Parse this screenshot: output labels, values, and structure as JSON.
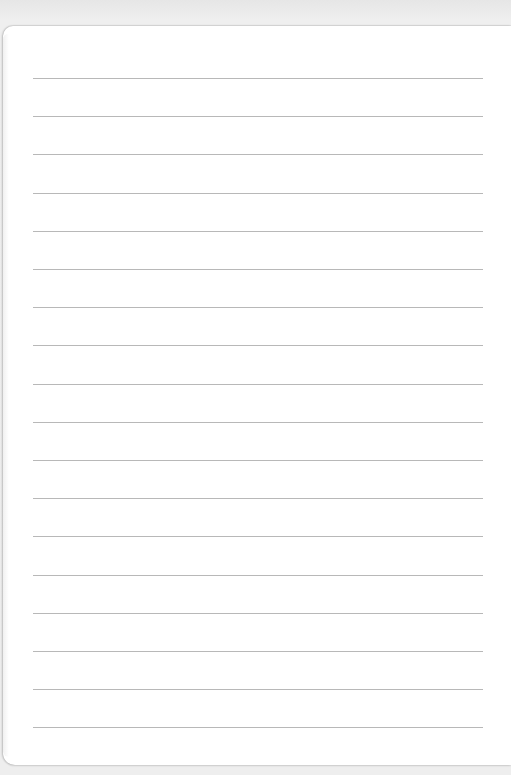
{
  "paper": {
    "line_count": 18,
    "first_line_y": 78,
    "line_spacing": 38.2,
    "line_left": 33,
    "line_right": 483,
    "line_color": "#b8b8b8",
    "paper_color": "#ffffff",
    "background_color": "#ececec"
  }
}
